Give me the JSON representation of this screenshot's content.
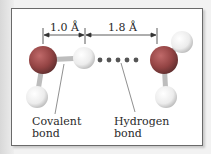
{
  "figure": {
    "dimensions": {
      "covalent_length": "1.0 Å",
      "hydrogen_bond_length": "1.8 Å"
    },
    "labels": {
      "covalent": "Covalent\nbond",
      "hydrogen": "Hydrogen\nbond"
    },
    "colors": {
      "oxygen": "#9a4848",
      "hydrogen": "#f4f4f4",
      "hbond_dots": "#555555",
      "frame": "#6a6a6a"
    }
  }
}
